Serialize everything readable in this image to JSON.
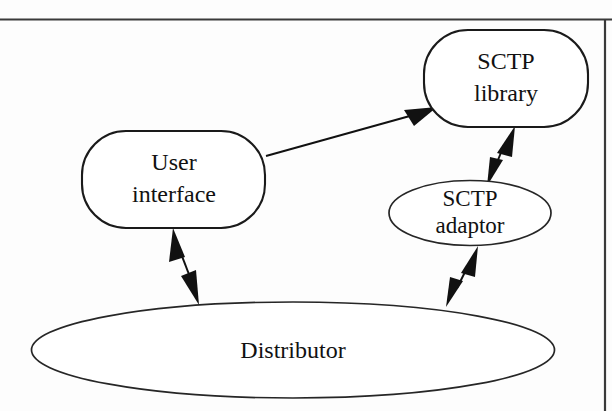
{
  "figure": {
    "kind": "architecture-block-diagram",
    "background_color": "#fdfdfd",
    "line_color": "#111111",
    "fill_color": "#ffffff",
    "frame": {
      "top_rule_label": "page-top-rule",
      "right_rule_label": "page-right-rule",
      "rule_color": "#3a3a3a"
    },
    "nodes": [
      {
        "id": "sctp-library",
        "shape": "rounded-rectangle",
        "line1": "SCTP",
        "line2": "library",
        "cx": 506,
        "cy": 78,
        "w": 164,
        "h": 97
      },
      {
        "id": "user-interface",
        "shape": "rounded-rectangle",
        "line1": "User",
        "line2": "interface",
        "cx": 174,
        "cy": 179,
        "w": 183,
        "h": 97
      },
      {
        "id": "sctp-adaptor",
        "shape": "ellipse",
        "line1": "SCTP",
        "line2": "adaptor",
        "cx": 470,
        "cy": 213,
        "w": 162,
        "h": 65
      },
      {
        "id": "distributor",
        "shape": "ellipse",
        "line1": "Distributor",
        "line2": "",
        "cx": 293,
        "cy": 350,
        "w": 523,
        "h": 96
      }
    ],
    "edges": [
      {
        "id": "ui-to-library",
        "from": "user-interface",
        "to": "sctp-library",
        "arrowheads": "single",
        "direction": "one-way"
      },
      {
        "id": "library-to-adaptor",
        "from": "sctp-library",
        "to": "sctp-adaptor",
        "arrowheads": "double",
        "direction": "bidirectional"
      },
      {
        "id": "ui-to-distributor",
        "from": "user-interface",
        "to": "distributor",
        "arrowheads": "double",
        "direction": "bidirectional"
      },
      {
        "id": "adaptor-to-distributor",
        "from": "sctp-adaptor",
        "to": "distributor",
        "arrowheads": "double",
        "direction": "bidirectional"
      }
    ]
  }
}
